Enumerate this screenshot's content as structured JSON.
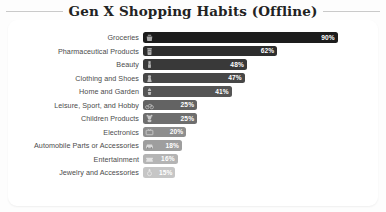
{
  "header": {
    "title": "Gen X Shopping Habits (Offline)"
  },
  "chart_data": {
    "type": "bar",
    "orientation": "horizontal",
    "title": "Gen X Shopping Habits (Offline)",
    "xlabel": "",
    "ylabel": "",
    "xlim": [
      0,
      100
    ],
    "grid": false,
    "legend": "none",
    "value_suffix": "%",
    "value_label_position": "inside-end",
    "categories": [
      "Groceries",
      "Pharmaceutical Products",
      "Beauty",
      "Clothing and Shoes",
      "Home and Garden",
      "Leisure, Sport, and Hobby",
      "Children Products",
      "Electronics",
      "Automobile Parts or Accessories",
      "Entertainment",
      "Jewelry and Accessories"
    ],
    "values": [
      90,
      62,
      48,
      47,
      41,
      25,
      25,
      20,
      18,
      16,
      15
    ],
    "value_labels": [
      "90%",
      "62%",
      "48%",
      "47%",
      "41%",
      "25%",
      "25%",
      "20%",
      "18%",
      "16%",
      "15%"
    ],
    "bar_colors": [
      "#1c1c1c",
      "#2e2e2e",
      "#393939",
      "#474747",
      "#555555",
      "#636363",
      "#6e6e6e",
      "#8e8e8e",
      "#9e9e9e",
      "#b4b4b4",
      "#c6c6c6"
    ],
    "icons": [
      "shopping-basket-icon",
      "pill-bottle-icon",
      "lipstick-icon",
      "dress-icon",
      "house-plant-icon",
      "bicycle-icon",
      "teddy-bear-icon",
      "tv-icon",
      "car-icon",
      "ticket-icon",
      "ring-icon"
    ]
  },
  "colors": {
    "page_background": "#fdfdfd",
    "card_background": "#ffffff",
    "title_color": "#222222",
    "label_color": "#4b4b4b",
    "value_color": "#ffffff",
    "rule_color": "#c9c9c9"
  }
}
